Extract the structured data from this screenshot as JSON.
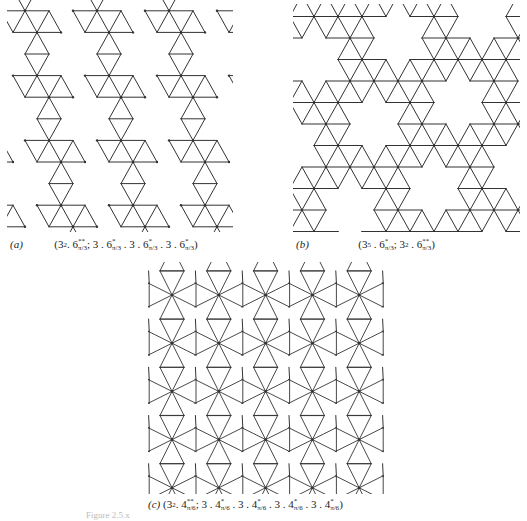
{
  "figure": {
    "footer_text": "Figure 2.5.x",
    "stroke_color": "#333333",
    "background": "#ffffff"
  },
  "panels": [
    {
      "id": "a",
      "tag": "(a)",
      "notation_parts": [
        {
          "t": "(3"
        },
        {
          "sup": "2"
        },
        {
          "t": ". 6"
        },
        {
          "sup": "**",
          "sub": "π/3"
        },
        {
          "t": "; 3 . 6"
        },
        {
          "sup": "*",
          "sub": "π/3"
        },
        {
          "t": " . 3 . 6"
        },
        {
          "sup": "*",
          "sub": "π/3"
        },
        {
          "t": " . 3 . 6"
        },
        {
          "sup": "*",
          "sub": "π/3"
        },
        {
          "t": ")"
        }
      ],
      "notation_plain": "(3^2 . 6**_{π/3}; 3 . 6*_{π/3} . 3 . 6*_{π/3} . 3 . 6*_{π/3})",
      "box": {
        "x": 7,
        "y": 0,
        "w": 226,
        "h": 232
      },
      "lattice": {
        "side": 24,
        "origin_x": 73,
        "origin_y": 54,
        "row_h": 21.6
      },
      "holes": {
        "v1": [
          3,
          0
        ],
        "v2": [
          0,
          3
        ],
        "v2_shift_cols": -1.5
      }
    },
    {
      "id": "b",
      "tag": "(b)",
      "notation_parts": [
        {
          "t": "(3"
        },
        {
          "sup": "5"
        },
        {
          "t": " . 6"
        },
        {
          "sup": "*",
          "sub": "π/3"
        },
        {
          "t": "; 3"
        },
        {
          "sup": "2"
        },
        {
          "t": " . 6"
        },
        {
          "sup": "**",
          "sub": "π/3"
        },
        {
          "t": ")"
        }
      ],
      "notation_plain": "(3^5 . 6*_{π/3}; 3^2 . 6**_{π/3})",
      "box": {
        "x": 293,
        "y": 4,
        "w": 227,
        "h": 228
      },
      "lattice": {
        "side": 24,
        "origin_x": 398,
        "origin_y": 38,
        "row_h": 21.5
      }
    },
    {
      "id": "c",
      "tag": "(c)",
      "notation_parts": [
        {
          "t": "(3"
        },
        {
          "sup": "2"
        },
        {
          "t": ". 4"
        },
        {
          "sup": "**",
          "sub": "π/6"
        },
        {
          "t": "; 3 . 4"
        },
        {
          "sup": "*",
          "sub": "π/6"
        },
        {
          "t": " . 3 . 4"
        },
        {
          "sup": "*",
          "sub": "π/6"
        },
        {
          "t": " . 3 . 4"
        },
        {
          "sup": "*",
          "sub": "π/6"
        },
        {
          "t": " . 3 . 4"
        },
        {
          "sup": "*",
          "sub": "π/6"
        },
        {
          "t": ")"
        }
      ],
      "notation_plain": "(3^2 . 4**_{π/6}; 3 . 4*_{π/6} . 3 . 4*_{π/6} . 3 . 4*_{π/6} . 3 . 4*_{π/6})",
      "box": {
        "x": 148,
        "y": 262,
        "w": 236,
        "h": 232
      },
      "grid": {
        "x0": 172,
        "y0": 295,
        "dx": 46.8,
        "dy": 48.2,
        "cols": 5,
        "rows": 5,
        "arm_short": 12,
        "arm_long": 24
      }
    }
  ]
}
